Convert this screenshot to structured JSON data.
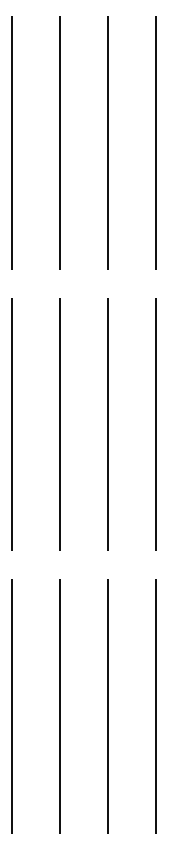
{
  "canvas": {
    "width": 172,
    "height": 854,
    "background": "#ffffff"
  },
  "bar_color": "#111111",
  "bar_width": 2,
  "bar_x": [
    11,
    59,
    107,
    155
  ],
  "groups": [
    {
      "label": "group-1",
      "top": 16,
      "bottom": 270
    },
    {
      "label": "group-2",
      "top": 298,
      "bottom": 551
    },
    {
      "label": "group-3",
      "top": 579,
      "bottom": 834
    }
  ]
}
